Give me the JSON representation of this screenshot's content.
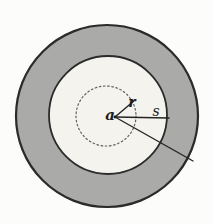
{
  "figure": {
    "background": "#fcfcfb",
    "width": 213,
    "height": 224,
    "colors": {
      "annulus_gray": "#aaaaa8",
      "disk_fill": "#f4f3ee",
      "outline": "#2b2b2b",
      "dotted": "#5f5f5d",
      "line": "#242424",
      "text": "#1c1c1c"
    },
    "circles": [
      {
        "name": "outer-annulus-circle",
        "cx": 107,
        "cy": 116,
        "r": 91,
        "fill": "#aaaaa8",
        "stroke": "#2b2b2b",
        "strokeWidth": 2.2,
        "dashed": false
      },
      {
        "name": "inner-disk-circle",
        "cx": 108,
        "cy": 115,
        "r": 59,
        "fill": "#f4f3ee",
        "stroke": "#2b2b2b",
        "strokeWidth": 1.8,
        "dashed": false
      },
      {
        "name": "dotted-radius-circle",
        "cx": 106,
        "cy": 116,
        "r": 30,
        "fill": "none",
        "stroke": "#5f5f5d",
        "strokeWidth": 1.2,
        "dashed": true
      }
    ],
    "lines": [
      {
        "name": "radius-r-line",
        "x1": 115,
        "y1": 117,
        "x2": 135,
        "y2": 100,
        "stroke": "#242424",
        "strokeWidth": 1.4
      },
      {
        "name": "radius-s-line",
        "x1": 115,
        "y1": 117,
        "x2": 169,
        "y2": 118,
        "stroke": "#242424",
        "strokeWidth": 1.4
      },
      {
        "name": "outer-secant-line",
        "x1": 115,
        "y1": 117,
        "x2": 193,
        "y2": 161,
        "stroke": "#242424",
        "strokeWidth": 1.4
      }
    ],
    "center_point": {
      "name": "center-point",
      "cx": 115,
      "cy": 117,
      "r": 1.4,
      "fill": "#1c1c1c"
    },
    "labels": [
      {
        "name": "label-a",
        "text": "a",
        "x": 110,
        "y": 120,
        "fontSize": 15,
        "bold": true,
        "italic": true
      },
      {
        "name": "label-r",
        "text": "r",
        "x": 132,
        "y": 107,
        "fontSize": 14,
        "bold": true,
        "italic": true
      },
      {
        "name": "label-s",
        "text": "s",
        "x": 156,
        "y": 116,
        "fontSize": 14,
        "bold": false,
        "italic": true
      }
    ]
  }
}
